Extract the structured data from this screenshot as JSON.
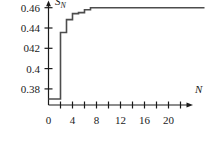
{
  "chart_data": {
    "type": "line",
    "subtype": "step",
    "title": "",
    "subtitle": "",
    "xlabel": "N",
    "ylabel": "S_N",
    "ylabel_display": "S",
    "ylabel_subscript": "N",
    "xlim": [
      0,
      22.5
    ],
    "ylim": [
      0.37,
      0.4665
    ],
    "grid": false,
    "legend": null,
    "x_ticks_major": [
      0,
      4,
      8,
      12,
      16,
      20
    ],
    "x_tick_labels": [
      "0",
      "4",
      "8",
      "12",
      "16",
      "20"
    ],
    "x_ticks_minor": [
      2,
      6,
      10,
      14,
      18,
      22
    ],
    "y_ticks": [
      0.46,
      0.44,
      0.42,
      0.4,
      0.38
    ],
    "y_tick_labels": [
      "0.46",
      "0.44",
      "042",
      "0.4",
      "0.38"
    ],
    "axis_arrows": [
      "x",
      "y"
    ],
    "series": [
      {
        "name": "S_N",
        "x": [
          0,
          1,
          2,
          3,
          4,
          5,
          6,
          7,
          8,
          9,
          10,
          11,
          12,
          13,
          14,
          15,
          16,
          17,
          18,
          19,
          20,
          21,
          22,
          26
        ],
        "values": [
          0.37,
          0.37,
          0.4355,
          0.4483,
          0.4542,
          0.4551,
          0.458,
          0.46,
          0.46,
          0.46,
          0.46,
          0.46,
          0.46,
          0.46,
          0.46,
          0.46,
          0.46,
          0.46,
          0.46,
          0.46,
          0.46,
          0.46,
          0.46,
          0.46
        ]
      }
    ]
  },
  "axes": {
    "y_label_0": "0.46",
    "y_label_1": "0.44",
    "y_label_2": "042",
    "y_label_3": "0.4",
    "y_label_4": "0.38",
    "x_label_0": "0",
    "x_label_1": "4",
    "x_label_2": "8",
    "x_label_3": "12",
    "x_label_4": "16",
    "x_label_5": "20",
    "x_axis_title": "N",
    "y_axis_title_base": "S",
    "y_axis_title_sub": "N"
  },
  "style": {
    "background": "#ffffff",
    "ink": "#1a1a1a",
    "curve_color": "#4d4d4d",
    "axis_color": "#1a1a1a"
  }
}
